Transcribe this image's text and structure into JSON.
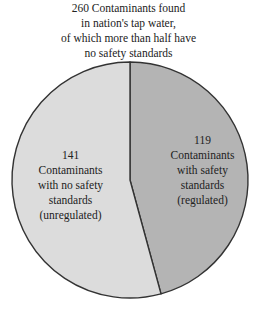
{
  "chart_data": {
    "type": "pie",
    "title": "260 Contaminants found in nation's tap water, of which more than half have no safety standards",
    "title_lines": [
      "260 Contaminants found",
      "in nation's tap water,",
      "of which more than half have",
      "no safety standards"
    ],
    "total": 260,
    "slices": [
      {
        "label": "Contaminants with safety standards (regulated)",
        "value": 119,
        "color": "#b4b4b4",
        "label_lines": [
          "119",
          "Contaminants",
          "with safety",
          "standards",
          "(regulated)"
        ]
      },
      {
        "label": "Contaminants with no safety standards (unregulated)",
        "value": 141,
        "color": "#dcdcdc",
        "label_lines": [
          "141",
          "Contaminants",
          "with no safety",
          "standards",
          "(unregulated)"
        ]
      }
    ],
    "start_angle_deg": 0,
    "direction": "clockwise",
    "legend": "none"
  }
}
